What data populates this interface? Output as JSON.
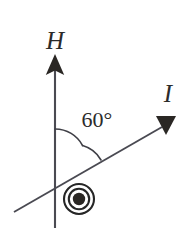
{
  "figure": {
    "type": "vector-diagram",
    "background_color": "#ffffff",
    "stroke_color": "#4a4a52",
    "ink_color": "#2a2724",
    "width": 189,
    "height": 238,
    "labels": {
      "field_vector": "H",
      "current_vector": "I",
      "angle": "60°"
    },
    "elements": {
      "field_axis": {
        "name": "H",
        "description": "vertical upward arrow",
        "direction_degrees": 90,
        "x": 55,
        "y_top": 55,
        "y_bottom": 228,
        "arrowhead": "solid-triangle-up"
      },
      "current_axis": {
        "name": "I",
        "description": "diagonal arrow pointing upper-right",
        "direction_degrees": 30,
        "x_start": 14,
        "y_start": 212,
        "x_end": 170,
        "y_end": 122,
        "arrowhead": "solid-triangle-down"
      },
      "angle_arc": {
        "value": 60,
        "unit": "degrees",
        "vertex_x": 55,
        "vertex_y": 160,
        "radius": 31,
        "from_degrees": 90,
        "to_degrees": 30
      },
      "current_out_of_page": {
        "symbol": "circle-dot",
        "meaning": "current directed out of the page",
        "cx": 79,
        "cy": 199,
        "outer_radius": 15,
        "inner_radius": 10,
        "dot_radius": 6
      }
    }
  }
}
